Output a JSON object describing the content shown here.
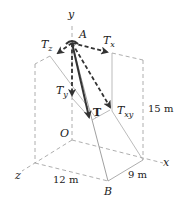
{
  "figure": {
    "labels": {
      "y_axis": "y",
      "x_axis": "x",
      "z_axis": "z",
      "point_a": "A",
      "origin": "O",
      "point_b": "B",
      "tz": {
        "main": "T",
        "sub": "z"
      },
      "tx": {
        "main": "T",
        "sub": "x"
      },
      "ty": {
        "main": "T",
        "sub": "y"
      },
      "txy": {
        "main": "T",
        "sub": "xy"
      },
      "t": "T"
    },
    "dimensions": {
      "height": "15 m",
      "z_length": "12 m",
      "x_length": "9 m"
    },
    "colors": {
      "arrow": "#333333",
      "frame": "#9a9a9a"
    }
  }
}
